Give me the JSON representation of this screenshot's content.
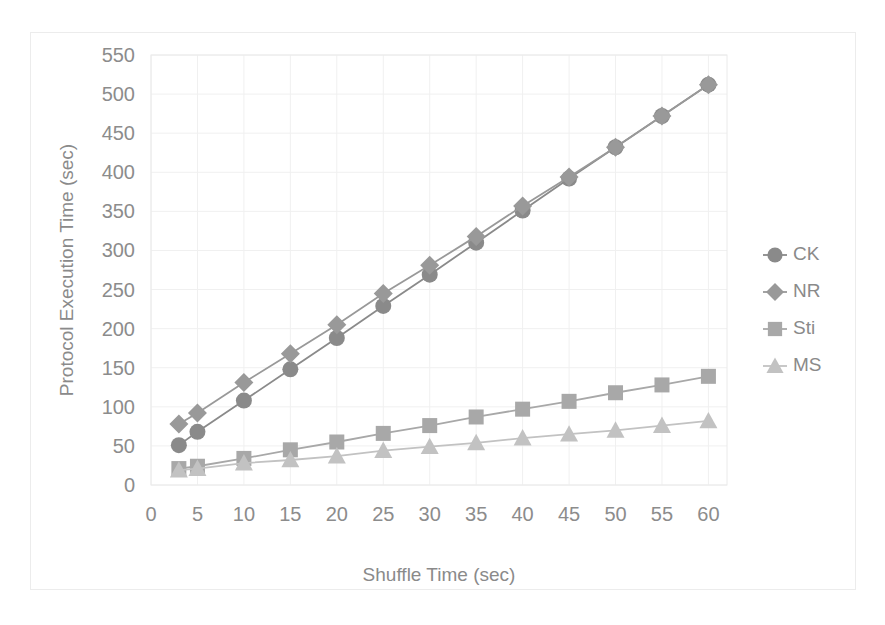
{
  "chart_data": {
    "type": "line",
    "title": "",
    "subtitle": "",
    "xlabel": "Shuffle Time (sec)",
    "ylabel": "Protocol Execution Time (sec)",
    "x": [
      3,
      5,
      10,
      15,
      20,
      25,
      30,
      35,
      40,
      45,
      50,
      55,
      60
    ],
    "xlim": [
      0,
      62
    ],
    "ylim": [
      0,
      550
    ],
    "x_ticks": [
      0,
      5,
      10,
      15,
      20,
      25,
      30,
      35,
      40,
      45,
      50,
      55,
      60
    ],
    "x_tick_labels": [
      "0",
      "5",
      "10",
      "15",
      "20",
      "25",
      "30",
      "35",
      "40",
      "45",
      "50",
      "55",
      "60"
    ],
    "y_ticks": [
      0,
      50,
      100,
      150,
      200,
      250,
      300,
      350,
      400,
      450,
      500,
      550
    ],
    "y_tick_labels": [
      "0",
      "50",
      "100",
      "150",
      "200",
      "250",
      "300",
      "350",
      "400",
      "450",
      "500",
      "550"
    ],
    "grid": true,
    "grid_axis": "both",
    "legend_position": "right",
    "series": [
      {
        "name": "CK",
        "marker": "circle",
        "color": "#8a8a8a",
        "values": [
          51,
          68,
          108,
          148,
          188,
          229,
          269,
          310,
          351,
          392,
          432,
          472,
          512
        ]
      },
      {
        "name": "NR",
        "marker": "diamond",
        "color": "#999999",
        "values": [
          78,
          92,
          131,
          168,
          205,
          245,
          281,
          318,
          357,
          394,
          432,
          472,
          512
        ]
      },
      {
        "name": "Sti",
        "marker": "square",
        "color": "#a8a8a8",
        "values": [
          21,
          24,
          34,
          45,
          55,
          66,
          76,
          87,
          97,
          107,
          118,
          128,
          139
        ]
      },
      {
        "name": "MS",
        "marker": "triangle",
        "color": "#c2c2c2",
        "values": [
          19,
          21,
          28,
          32,
          37,
          44,
          49,
          54,
          60,
          65,
          70,
          76,
          82
        ]
      }
    ],
    "annotations": []
  },
  "legend": {
    "items": [
      {
        "label": "CK"
      },
      {
        "label": "NR"
      },
      {
        "label": "Sti"
      },
      {
        "label": "MS"
      }
    ]
  },
  "colors": {
    "grid": "#f0f0f0",
    "frame": "#eaeaea",
    "text": "#8a8a8a",
    "background": "#ffffff"
  }
}
